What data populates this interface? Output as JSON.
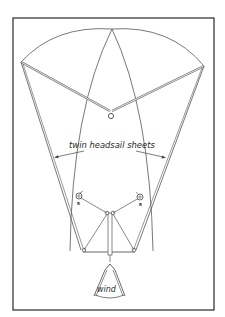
{
  "figure": {
    "type": "sailing rig diagram (plan view)",
    "frame_color": "#3a3a3a",
    "line_color": "#555555",
    "labels": {
      "sheets": "twin headsail sheets",
      "wind": "wind"
    },
    "winches": {
      "left": {
        "id": "R"
      },
      "right": {
        "id": "R"
      }
    }
  }
}
